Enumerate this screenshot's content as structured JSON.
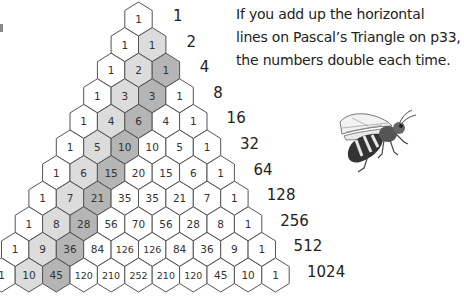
{
  "caption": {
    "lines": [
      "If you add up the horizontal",
      "lines on Pascal’s Triangle on p33,",
      "the numbers double each time."
    ]
  },
  "triangle": {
    "rows": [
      [
        1
      ],
      [
        1,
        1
      ],
      [
        1,
        2,
        1
      ],
      [
        1,
        3,
        3,
        1
      ],
      [
        1,
        4,
        6,
        4,
        1
      ],
      [
        1,
        5,
        10,
        10,
        5,
        1
      ],
      [
        1,
        6,
        15,
        20,
        15,
        6,
        1
      ],
      [
        1,
        7,
        21,
        35,
        35,
        21,
        7,
        1
      ],
      [
        1,
        8,
        28,
        56,
        70,
        56,
        28,
        8,
        1
      ],
      [
        1,
        9,
        36,
        84,
        126,
        126,
        84,
        36,
        9,
        1
      ],
      [
        1,
        10,
        45,
        120,
        210,
        252,
        210,
        120,
        45,
        10,
        1
      ]
    ],
    "row_sums": [
      "1",
      "2",
      "4",
      "8",
      "16",
      "32",
      "64",
      "128",
      "256",
      "512",
      "1024"
    ],
    "colors": {
      "cell_fill": "#ffffff",
      "cell_stroke": "#555555",
      "diagonal_1_fill": "#dcdcdc",
      "diagonal_2_fill": "#b5b5b5",
      "text": "#333333"
    }
  },
  "illustration": {
    "icon": "bee-icon"
  }
}
